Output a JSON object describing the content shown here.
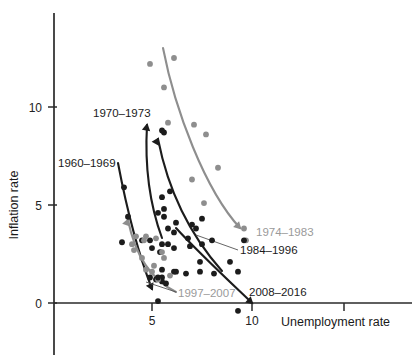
{
  "chart_data": {
    "type": "scatter",
    "title": "",
    "xlabel": "Unemployment rate",
    "ylabel": "Inflation rate",
    "xlim": [
      0,
      13.5
    ],
    "ylim": [
      -1.2,
      14.2
    ],
    "xticks": [
      5,
      10
    ],
    "yticks": [
      0,
      5,
      10
    ],
    "xtick_labels": [
      "5",
      "10"
    ],
    "ytick_labels": [
      "0",
      "5",
      "10"
    ],
    "grid": false,
    "legend_position": "inline-annotations",
    "colors": {
      "dark": "#1c1c1c",
      "gray": "#8e8e8e",
      "axis": "#2a2a2a",
      "background": "#ffffff"
    },
    "series": [
      {
        "name": "1960-1969",
        "label": "1960–1969",
        "color": "dark",
        "label_x": 58,
        "label_y": 167,
        "points": [
          {
            "x": 5.5,
            "y": 1.3
          },
          {
            "x": 5.5,
            "y": 1.1
          },
          {
            "x": 5.2,
            "y": 1.2
          },
          {
            "x": 5.7,
            "y": 1.0
          },
          {
            "x": 6.7,
            "y": 1.5
          },
          {
            "x": 5.5,
            "y": 1.7
          },
          {
            "x": 5.5,
            "y": 3.0
          },
          {
            "x": 5.0,
            "y": 2.8
          },
          {
            "x": 4.5,
            "y": 3.2
          },
          {
            "x": 3.8,
            "y": 4.4
          },
          {
            "x": 3.6,
            "y": 5.9
          },
          {
            "x": 3.5,
            "y": 3.1
          }
        ]
      },
      {
        "name": "1970-1973",
        "label": "1970–1973",
        "color": "dark",
        "label_x": 93,
        "label_y": 117,
        "points": [
          {
            "x": 5.9,
            "y": 5.7
          },
          {
            "x": 5.6,
            "y": 4.4
          },
          {
            "x": 4.9,
            "y": 3.2
          },
          {
            "x": 5.6,
            "y": 8.7
          },
          {
            "x": 5.5,
            "y": 8.8
          }
        ]
      },
      {
        "name": "1974-1983",
        "label": "1974–1983",
        "color": "gray",
        "label_x": 256,
        "label_y": 236,
        "points": [
          {
            "x": 5.6,
            "y": 11.0
          },
          {
            "x": 4.9,
            "y": 12.2
          },
          {
            "x": 6.1,
            "y": 12.5
          },
          {
            "x": 7.1,
            "y": 9.1
          },
          {
            "x": 5.8,
            "y": 9.2
          },
          {
            "x": 7.7,
            "y": 8.6
          },
          {
            "x": 8.3,
            "y": 6.9
          },
          {
            "x": 7.0,
            "y": 6.3
          },
          {
            "x": 7.6,
            "y": 5.1
          },
          {
            "x": 9.7,
            "y": 3.2
          },
          {
            "x": 9.6,
            "y": 3.8
          }
        ]
      },
      {
        "name": "1984-1996",
        "label": "1984–1996",
        "color": "dark",
        "label_x": 240,
        "label_y": 254,
        "points": [
          {
            "x": 7.5,
            "y": 4.3
          },
          {
            "x": 7.2,
            "y": 3.8
          },
          {
            "x": 7.0,
            "y": 4.0
          },
          {
            "x": 6.2,
            "y": 4.1
          },
          {
            "x": 6.1,
            "y": 3.6
          },
          {
            "x": 5.6,
            "y": 4.8
          },
          {
            "x": 5.5,
            "y": 5.4
          },
          {
            "x": 5.3,
            "y": 4.6
          },
          {
            "x": 6.8,
            "y": 3.3
          },
          {
            "x": 7.5,
            "y": 3.0
          },
          {
            "x": 6.9,
            "y": 2.9
          },
          {
            "x": 6.1,
            "y": 2.8
          },
          {
            "x": 5.8,
            "y": 3.0
          },
          {
            "x": 7.4,
            "y": 1.6
          },
          {
            "x": 6.1,
            "y": 1.6
          },
          {
            "x": 5.4,
            "y": 2.6
          }
        ]
      },
      {
        "name": "1997-2007",
        "label": "1997–2007",
        "color": "gray",
        "label_x": 178,
        "label_y": 297,
        "points": [
          {
            "x": 4.7,
            "y": 3.4
          },
          {
            "x": 4.6,
            "y": 3.2
          },
          {
            "x": 4.2,
            "y": 3.4
          },
          {
            "x": 4.0,
            "y": 3.0
          },
          {
            "x": 4.1,
            "y": 2.7
          },
          {
            "x": 4.5,
            "y": 2.3
          },
          {
            "x": 5.2,
            "y": 3.3
          },
          {
            "x": 5.5,
            "y": 2.6
          },
          {
            "x": 5.6,
            "y": 2.3
          },
          {
            "x": 5.1,
            "y": 1.9
          },
          {
            "x": 4.7,
            "y": 1.7
          },
          {
            "x": 5.3,
            "y": 1.2
          },
          {
            "x": 5.0,
            "y": 1.6
          },
          {
            "x": 5.9,
            "y": 1.4
          }
        ]
      },
      {
        "name": "2008-2016",
        "label": "2008–2016",
        "color": "dark",
        "label_x": 249,
        "label_y": 296,
        "points": [
          {
            "x": 5.8,
            "y": 3.8
          },
          {
            "x": 9.3,
            "y": 1.6
          },
          {
            "x": 9.6,
            "y": 3.2
          },
          {
            "x": 8.9,
            "y": 2.1
          },
          {
            "x": 8.1,
            "y": 1.5
          },
          {
            "x": 8.0,
            "y": 3.2
          },
          {
            "x": 7.4,
            "y": 2.1
          },
          {
            "x": 6.2,
            "y": 1.6
          },
          {
            "x": 5.3,
            "y": 1.3
          },
          {
            "x": 5.3,
            "y": 0.1
          },
          {
            "x": 9.3,
            "y": -0.4
          },
          {
            "x": 4.9,
            "y": 1.3
          }
        ]
      }
    ],
    "trend_curves": [
      {
        "name": "1960-1969",
        "color": "dark",
        "path": "M 118 163 C 125 200, 135 245, 152 289",
        "arrow_at": [
          152,
          289
        ],
        "arrow_angle": 65
      },
      {
        "name": "1970-1973",
        "color": "dark",
        "path": "M 147 125 C 145 160, 148 200, 162 238",
        "arrow_at": [
          147,
          125
        ],
        "arrow_angle": -80
      },
      {
        "name": "1974-1983",
        "color": "gray",
        "path": "M 163 48 C 175 110, 205 190, 240 228",
        "arrow_at": [
          240,
          228
        ],
        "arrow_angle": 45
      },
      {
        "name": "1984-1996",
        "color": "dark",
        "path": "M 158 139 C 168 190, 190 235, 222 271",
        "arrow_at": [
          158,
          139
        ],
        "arrow_angle": -60
      },
      {
        "name": "1997-2007",
        "color": "gray",
        "path": "M 128 220 C 134 250, 148 278, 176 292",
        "arrow_at": [
          128,
          220
        ],
        "arrow_angle": -70
      },
      {
        "name": "2008-2016",
        "color": "dark",
        "path": "M 176 228 C 196 250, 228 280, 252 303",
        "arrow_at": [
          252,
          303
        ],
        "arrow_angle": 42
      }
    ],
    "callouts": [
      {
        "name": "1984-1996",
        "from": [
          238,
          250
        ],
        "to": [
          196,
          235
        ]
      },
      {
        "name": "1997-2007",
        "from": [
          176,
          292
        ],
        "to": [
          146,
          282
        ]
      }
    ]
  }
}
